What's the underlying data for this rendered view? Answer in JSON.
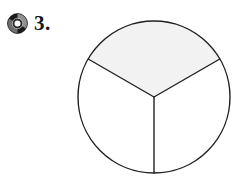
{
  "page": {
    "background_color": "#ffffff",
    "kind": "worksheet-fraction-question"
  },
  "question_marker": {
    "bullet_icon": "compact-disc-icon",
    "bullet_colors": {
      "disc_dark": "#1a1a1a",
      "disc_highlight": "#9a9a9a",
      "disc_hole": "#fdfdfd"
    },
    "number_label": "3."
  },
  "figure": {
    "name": "fraction-circle",
    "shape": "circle",
    "total_parts": 3,
    "shaded_parts": 1,
    "fraction_label": "1/3",
    "outline_color": "#231f20",
    "outline_width": 1.4,
    "shaded_fill": "#f2f2f2",
    "unshaded_fill": "#ffffff",
    "center": {
      "x": 78,
      "y": 87
    },
    "radius": 76,
    "sectors": [
      {
        "id": "sector-top",
        "label": "top-sector",
        "shaded": true,
        "start_angle_deg": 150,
        "end_angle_deg": 30,
        "sweep_deg": 120
      },
      {
        "id": "sector-lower-left",
        "label": "lower-left-sector",
        "shaded": false,
        "start_angle_deg": 150,
        "end_angle_deg": 270,
        "sweep_deg": 120
      },
      {
        "id": "sector-lower-right",
        "label": "lower-right-sector",
        "shaded": false,
        "start_angle_deg": 270,
        "end_angle_deg": 30,
        "sweep_deg": 120
      }
    ],
    "radii_lines": [
      {
        "id": "radius-upper-left",
        "angle_deg": 150
      },
      {
        "id": "radius-upper-right",
        "angle_deg": 30
      },
      {
        "id": "radius-down",
        "angle_deg": 270
      }
    ]
  }
}
